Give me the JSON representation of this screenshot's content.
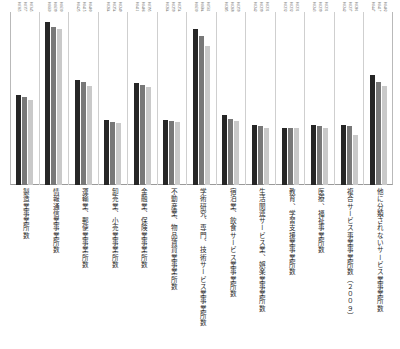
{
  "chart_data": {
    "type": "bar",
    "title": "",
    "xlabel": "",
    "ylabel": "",
    "ylim": [
      0,
      0.07
    ],
    "grid": false,
    "legend": "none",
    "categories": [
      "製造業事業所数",
      "情報通信業事業所数",
      "運輸業、郵便業事業所数",
      "卸売業、小売業事業所数",
      "金融業、保険業事業所数",
      "不動産業、物品賃貸業事業所数",
      "学術研究、専門、技術サービス業事業所数",
      "宿泊業、飲食サービス業事業所数",
      "生活関連サービス業、娯楽業事業所数",
      "教育、学習支援業事業所数",
      "医療、福祉事業所数",
      "複合サービス事業事業所数（２００９）",
      "他に分類されないサービス業事業所数"
    ],
    "series": [
      {
        "name": "series-1",
        "color": "#262626",
        "values": [
          0.0365,
          0.066,
          0.0425,
          0.0264,
          0.0411,
          0.0264,
          0.063,
          0.0285,
          0.0242,
          0.0232,
          0.0243,
          0.0242,
          0.0447
        ]
      },
      {
        "name": "series-2",
        "color": "#787878",
        "values": [
          0.0357,
          0.0639,
          0.0415,
          0.0254,
          0.0406,
          0.0259,
          0.0604,
          0.0268,
          0.0239,
          0.0232,
          0.0239,
          0.0237,
          0.0417
        ]
      },
      {
        "name": "series-3",
        "color": "#c9c9c9",
        "values": [
          0.0345,
          0.063,
          0.04,
          0.0249,
          0.0395,
          0.0254,
          0.0561,
          0.0259,
          0.0231,
          0.0231,
          0.0231,
          0.0201,
          0.0402
        ]
      }
    ],
    "bar_labels": [
      [
        "0.0365",
        "0.0357",
        "0.0345"
      ],
      [
        "0.0660",
        "0.0639",
        "0.0630"
      ],
      [
        "0.0425",
        "0.0415",
        "0.0400"
      ],
      [
        "0.0264",
        "0.0254",
        "0.0249"
      ],
      [
        "0.0411",
        "0.0406",
        "0.0395"
      ],
      [
        "0.0264",
        "0.0259",
        "0.0254"
      ],
      [
        "0.0630",
        "0.0604",
        "0.0561"
      ],
      [
        "0.0285",
        "0.0268",
        "0.0259"
      ],
      [
        "0.0242",
        "0.0239",
        "0.0231"
      ],
      [
        "0.0232",
        "0.0232",
        "0.0231"
      ],
      [
        "0.0243",
        "0.0239",
        "0.0231"
      ],
      [
        "0.0242",
        "0.0237",
        "0.0201"
      ],
      [
        "0.0447",
        "0.0417",
        "0.0402"
      ]
    ]
  }
}
